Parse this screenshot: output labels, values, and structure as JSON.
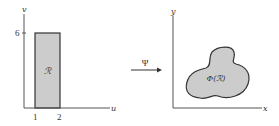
{
  "diagram": {
    "left_plot": {
      "vertical_axis_label": "v",
      "horizontal_axis_label": "u",
      "y_tick_label": "6",
      "x_tick_labels": [
        "1",
        "2"
      ],
      "region_label": "ℛ",
      "region_fill": "#cccccc"
    },
    "mapping": {
      "label": "Ψ"
    },
    "right_plot": {
      "vertical_axis_label": "y",
      "horizontal_axis_label": "x",
      "region_label": "Φ(ℛ)",
      "region_fill": "#cccccc"
    },
    "colors": {
      "stroke": "#333333",
      "axis": "#555555"
    }
  }
}
